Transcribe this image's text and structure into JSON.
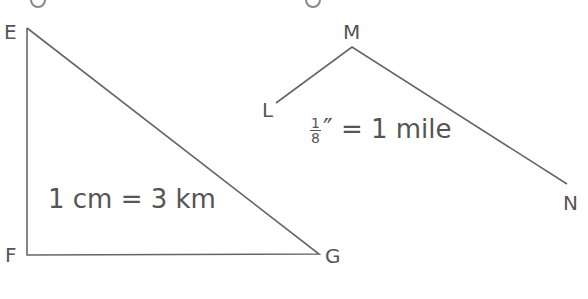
{
  "colors": {
    "line": "#666666",
    "text": "#555555",
    "background": "#ffffff"
  },
  "triangle_EFG": {
    "vertices": {
      "E": {
        "label": "E",
        "x": 27,
        "y": 28
      },
      "F": {
        "label": "F",
        "x": 27,
        "y": 255
      },
      "G": {
        "label": "G",
        "x": 319,
        "y": 254
      }
    },
    "scale_text": "1 cm = 3 km"
  },
  "path_LMN": {
    "vertices": {
      "L": {
        "label": "L",
        "x": 276,
        "y": 103
      },
      "M": {
        "label": "M",
        "x": 352,
        "y": 47
      },
      "N": {
        "label": "N",
        "x": 567,
        "y": 184
      }
    },
    "scale": {
      "numerator": "1",
      "denominator": "8",
      "unit_symbol": "″",
      "rest": " = 1 mile"
    }
  }
}
